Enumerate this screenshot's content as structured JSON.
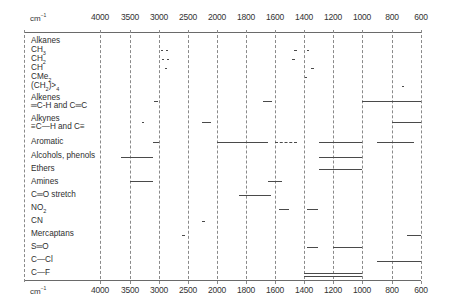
{
  "chart_data": {
    "type": "table",
    "xlabel": "cm⁻¹",
    "unit_label": "cm⁻¹",
    "x_ticks": [
      4000,
      3500,
      3000,
      2500,
      2000,
      1800,
      1600,
      1400,
      1200,
      1000,
      800,
      600
    ],
    "x_tick_px": [
      100,
      130,
      159,
      188,
      217,
      246,
      275,
      304,
      333,
      362,
      392,
      421
    ],
    "xlim": [
      4000,
      600
    ],
    "grid": true,
    "groups": [
      {
        "label": "Alkanes",
        "y": 40,
        "bands": []
      },
      {
        "label": "CH3",
        "sub": "3",
        "base": "CH",
        "y": 50,
        "bands": [
          {
            "from": 2960,
            "to": 2940,
            "style": "solid"
          },
          {
            "from": 2880,
            "to": 2860,
            "style": "solid"
          },
          {
            "from": 1470,
            "to": 1450,
            "style": "solid"
          },
          {
            "from": 1380,
            "to": 1370,
            "style": "solid"
          }
        ]
      },
      {
        "label": "CH2",
        "sub": "2",
        "base": "CH",
        "y": 59,
        "bands": [
          {
            "from": 2940,
            "to": 2915,
            "style": "solid"
          },
          {
            "from": 2870,
            "to": 2845,
            "style": "solid"
          },
          {
            "from": 1480,
            "to": 1460,
            "style": "solid"
          }
        ]
      },
      {
        "label": "CH",
        "y": 68,
        "bands": [
          {
            "from": 2900,
            "to": 2880,
            "style": "solid"
          },
          {
            "from": 1350,
            "to": 1330,
            "style": "solid"
          }
        ]
      },
      {
        "label": "CMe2",
        "sub": "2",
        "base": "CMe",
        "y": 77,
        "bands": [
          {
            "from": 1390,
            "to": 1380,
            "style": "solid"
          }
        ]
      },
      {
        "label": "(CH2)>4",
        "y": 86,
        "bands": [
          {
            "from": 730,
            "to": 720,
            "style": "solid"
          }
        ]
      },
      {
        "label": "Alkenes",
        "y": 97,
        "bands": []
      },
      {
        "label": "═C-H and C═C",
        "y": 101,
        "bands": [
          {
            "from": 3080,
            "to": 3010,
            "style": "solid"
          },
          {
            "from": 1680,
            "to": 1620,
            "style": "solid"
          },
          {
            "from": 1000,
            "to": 600,
            "style": "solid"
          }
        ]
      },
      {
        "label": "Alkynes",
        "y": 116,
        "bands": []
      },
      {
        "label": "≡C—H and C≡",
        "y": 122,
        "bands": [
          {
            "from": 3300,
            "to": 3250,
            "style": "solid"
          },
          {
            "from": 2260,
            "to": 2100,
            "style": "solid"
          },
          {
            "from": 800,
            "to": 600,
            "style": "solid"
          }
        ]
      },
      {
        "label": "Aromatic",
        "y": 142,
        "bands": [
          {
            "from": 3100,
            "to": 3000,
            "style": "solid"
          },
          {
            "from": 2000,
            "to": 1650,
            "style": "solid"
          },
          {
            "from": 1600,
            "to": 1450,
            "style": "dashed"
          },
          {
            "from": 1300,
            "to": 1000,
            "style": "solid"
          },
          {
            "from": 900,
            "to": 650,
            "style": "solid"
          }
        ]
      },
      {
        "label": "Alcohols, phenols",
        "y": 157,
        "bands": [
          {
            "from": 3650,
            "to": 3100,
            "style": "solid"
          },
          {
            "from": 1300,
            "to": 1000,
            "style": "solid"
          }
        ]
      },
      {
        "label": "Ethers",
        "y": 169,
        "bands": [
          {
            "from": 1300,
            "to": 1000,
            "style": "solid"
          }
        ]
      },
      {
        "label": "Amines",
        "y": 181,
        "bands": [
          {
            "from": 3500,
            "to": 3100,
            "style": "solid"
          },
          {
            "from": 1650,
            "to": 1550,
            "style": "solid"
          }
        ]
      },
      {
        "label": "C═O stretch",
        "y": 195,
        "bands": [
          {
            "from": 1850,
            "to": 1630,
            "style": "solid"
          }
        ]
      },
      {
        "label": "NO2",
        "sub": "2",
        "base": "NO",
        "y": 209,
        "bands": [
          {
            "from": 1570,
            "to": 1500,
            "style": "solid"
          },
          {
            "from": 1380,
            "to": 1300,
            "style": "solid"
          }
        ]
      },
      {
        "label": "CN",
        "y": 221,
        "bands": [
          {
            "from": 2260,
            "to": 2200,
            "style": "solid"
          }
        ]
      },
      {
        "label": "Mercaptans",
        "y": 235,
        "bands": [
          {
            "from": 2600,
            "to": 2550,
            "style": "solid"
          },
          {
            "from": 700,
            "to": 600,
            "style": "solid"
          }
        ]
      },
      {
        "label": "S═O",
        "y": 247,
        "bands": [
          {
            "from": 1380,
            "to": 1300,
            "style": "solid"
          },
          {
            "from": 1200,
            "to": 1000,
            "style": "solid"
          }
        ]
      },
      {
        "label": "C—Cl",
        "y": 261,
        "bands": [
          {
            "from": 900,
            "to": 600,
            "style": "solid"
          }
        ]
      },
      {
        "label": "C—F",
        "y": 273,
        "bands": [
          {
            "from": 1400,
            "to": 1000,
            "style": "double"
          }
        ]
      }
    ]
  },
  "axis": {
    "unit_top": "cm",
    "unit_bottom": "cm",
    "unit_sup": "−1",
    "ticks": [
      "4000",
      "3500",
      "3000",
      "2500",
      "2000",
      "1800",
      "1600",
      "1400",
      "1200",
      "1000",
      "800",
      "600"
    ]
  },
  "rows": [
    {
      "text": "Alkanes"
    },
    {
      "base": "CH",
      "sub": "3"
    },
    {
      "base": "CH",
      "sub": "2"
    },
    {
      "text": "CH"
    },
    {
      "base": "CMe",
      "sub": "2"
    },
    {
      "base": "(CH",
      "sub": "2",
      "tail": ")>",
      "sub2": "4"
    },
    {
      "text": "Alkenes"
    },
    {
      "text": "═C-H and C═C"
    },
    {
      "text": "Alkynes"
    },
    {
      "text": "≡C—H and C≡"
    },
    {
      "text": "Aromatic"
    },
    {
      "text": "Alcohols, phenols"
    },
    {
      "text": "Ethers"
    },
    {
      "text": "Amines"
    },
    {
      "text": "C═O stretch"
    },
    {
      "base": "NO",
      "sub": "2"
    },
    {
      "text": "CN"
    },
    {
      "text": "Mercaptans"
    },
    {
      "text": "S═O"
    },
    {
      "text": "C—Cl"
    },
    {
      "text": "C—F"
    }
  ],
  "row_y": [
    36,
    45,
    54,
    63,
    72,
    81,
    93,
    101,
    114,
    122,
    137,
    151,
    164,
    177,
    190,
    203,
    216,
    229,
    242,
    255,
    268
  ]
}
